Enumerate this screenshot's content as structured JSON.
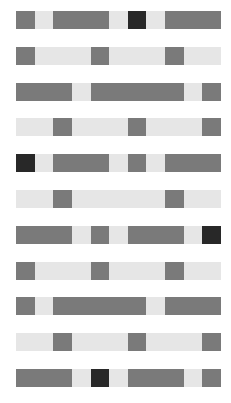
{
  "palette": {
    "G": "#7a7a7a",
    "L": "#e6e6e6",
    "D": "#282828"
  },
  "grid": {
    "rows": 11,
    "cols": 11,
    "cells": [
      [
        "G",
        "L",
        "G",
        "G",
        "G",
        "L",
        "D",
        "L",
        "G",
        "G",
        "G"
      ],
      [
        "G",
        "L",
        "L",
        "L",
        "G",
        "L",
        "L",
        "L",
        "G",
        "L",
        "L"
      ],
      [
        "G",
        "G",
        "G",
        "L",
        "G",
        "G",
        "G",
        "G",
        "G",
        "L",
        "G"
      ],
      [
        "L",
        "L",
        "G",
        "L",
        "L",
        "L",
        "G",
        "L",
        "L",
        "L",
        "G"
      ],
      [
        "D",
        "L",
        "G",
        "G",
        "G",
        "L",
        "G",
        "L",
        "G",
        "G",
        "G"
      ],
      [
        "L",
        "L",
        "G",
        "L",
        "L",
        "L",
        "L",
        "L",
        "G",
        "L",
        "L"
      ],
      [
        "G",
        "G",
        "G",
        "L",
        "G",
        "L",
        "G",
        "G",
        "G",
        "L",
        "D"
      ],
      [
        "G",
        "L",
        "L",
        "L",
        "G",
        "L",
        "L",
        "L",
        "G",
        "L",
        "L"
      ],
      [
        "G",
        "L",
        "G",
        "G",
        "G",
        "G",
        "G",
        "L",
        "G",
        "G",
        "G"
      ],
      [
        "L",
        "L",
        "G",
        "L",
        "L",
        "L",
        "G",
        "L",
        "L",
        "L",
        "G"
      ],
      [
        "G",
        "G",
        "G",
        "L",
        "D",
        "L",
        "G",
        "G",
        "G",
        "L",
        "G"
      ]
    ]
  }
}
